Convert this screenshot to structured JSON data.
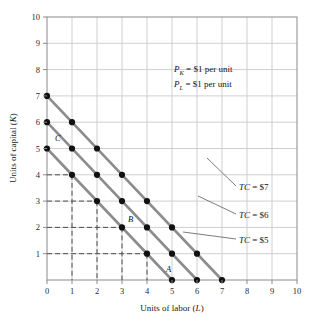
{
  "chart_data": {
    "type": "line",
    "title": "",
    "xlabel": "Units of labor (L)",
    "ylabel": "Units of capital (K)",
    "xlim": [
      0,
      10
    ],
    "ylim": [
      0,
      10
    ],
    "x_ticks": [
      0,
      1,
      2,
      3,
      4,
      5,
      6,
      7,
      8,
      9,
      10
    ],
    "y_ticks": [
      0,
      1,
      2,
      3,
      4,
      5,
      6,
      7,
      8,
      9,
      10
    ],
    "grid": true,
    "legend_position": "none",
    "series": [
      {
        "name": "TC = $7",
        "label": "TC = $7",
        "color": "#8c8c8c",
        "x": [
          0,
          7
        ],
        "y": [
          7,
          0
        ],
        "points": [
          {
            "x": 0,
            "y": 7
          },
          {
            "x": 1,
            "y": 6
          },
          {
            "x": 2,
            "y": 5
          },
          {
            "x": 3,
            "y": 4
          },
          {
            "x": 4,
            "y": 3
          },
          {
            "x": 5,
            "y": 2
          },
          {
            "x": 6,
            "y": 1
          },
          {
            "x": 7,
            "y": 0
          }
        ]
      },
      {
        "name": "TC = $6",
        "label": "TC = $6",
        "color": "#8c8c8c",
        "x": [
          0,
          6
        ],
        "y": [
          6,
          0
        ],
        "points": [
          {
            "x": 0,
            "y": 6
          },
          {
            "x": 1,
            "y": 5
          },
          {
            "x": 2,
            "y": 4
          },
          {
            "x": 3,
            "y": 3
          },
          {
            "x": 4,
            "y": 2
          },
          {
            "x": 5,
            "y": 1
          },
          {
            "x": 6,
            "y": 0
          }
        ]
      },
      {
        "name": "TC = $5",
        "label": "TC = $5",
        "color": "#8c8c8c",
        "x": [
          0,
          5
        ],
        "y": [
          5,
          0
        ],
        "points": [
          {
            "x": 0,
            "y": 5
          },
          {
            "x": 1,
            "y": 4
          },
          {
            "x": 2,
            "y": 3
          },
          {
            "x": 3,
            "y": 2
          },
          {
            "x": 4,
            "y": 1
          },
          {
            "x": 5,
            "y": 0
          }
        ]
      }
    ],
    "labeled_points": [
      {
        "label": "C",
        "x": 0,
        "y": 5
      },
      {
        "label": "B",
        "x": 3,
        "y": 2
      },
      {
        "label": "A",
        "x": 5,
        "y": 0
      }
    ],
    "dashed_guides": [
      {
        "x": 1,
        "y": 4
      },
      {
        "x": 2,
        "y": 3
      },
      {
        "x": 3,
        "y": 2
      },
      {
        "x": 4,
        "y": 1
      }
    ],
    "annotations": [
      {
        "text": "P_K = $1 per unit",
        "sub": "K",
        "prefix": "P",
        "suffix": " = $1 per unit",
        "x": 5.1,
        "y": 7.75
      },
      {
        "text": "P_L = $1 per unit",
        "sub": "L",
        "prefix": "P",
        "suffix": " = $1 per unit",
        "x": 5.1,
        "y": 7.1
      }
    ]
  },
  "axes": {
    "x_title_prefix": "Units of labor (",
    "x_title_var": "L",
    "x_title_suffix": ")",
    "y_title_prefix": "Units of capital (",
    "y_title_var": "K",
    "y_title_suffix": ")"
  },
  "ticks": {
    "x": [
      "0",
      "1",
      "2",
      "3",
      "4",
      "5",
      "6",
      "7",
      "8",
      "9",
      "10"
    ],
    "y": [
      "1",
      "2",
      "3",
      "4",
      "5",
      "6",
      "7",
      "8",
      "9",
      "10"
    ]
  },
  "annotations": {
    "price_capital_var": "P",
    "price_capital_sub": "K",
    "price_capital_text": " = $1 per unit",
    "price_labor_var": "P",
    "price_labor_sub": "L",
    "price_labor_text": " = $1 per unit"
  },
  "curve_labels": [
    {
      "prefix": "TC",
      "suffix": " = $7"
    },
    {
      "prefix": "TC",
      "suffix": " = $6"
    },
    {
      "prefix": "TC",
      "suffix": " = $5"
    }
  ],
  "point_labels": {
    "a": "A",
    "b": "B",
    "c": "C"
  },
  "colors": {
    "isocost_line": "#8c8c8c",
    "gridline": "#cfcfcf",
    "axis": "#8a8a8a",
    "marker": "#111111",
    "dashed_guide": "#4d4d4d",
    "leader_line": "#5a5a5a",
    "background": "#ffffff"
  }
}
